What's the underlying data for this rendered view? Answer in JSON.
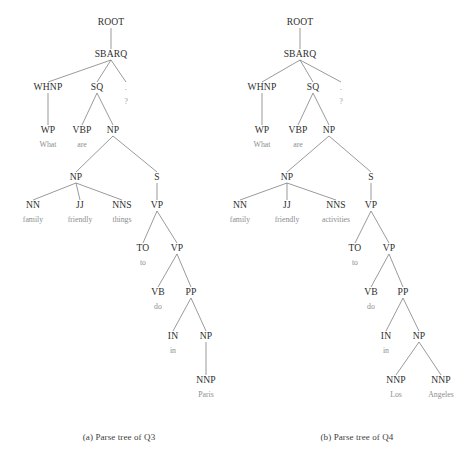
{
  "figure": {
    "background_color": "#ffffff",
    "node_color": "#2e2e2e",
    "leaf_color": "#8d8d8d",
    "edge_color": "#6f6f6f"
  },
  "subfigures": [
    {
      "id": "a",
      "caption": "(a) Parse tree of Q3",
      "sentence": "What are family friendly things to do in Paris ?",
      "nodes": [
        {
          "id": "a-root",
          "label": "ROOT",
          "x": 111,
          "y": 25,
          "type": "nonterminal"
        },
        {
          "id": "a-sbarq",
          "label": "SBARQ",
          "x": 111,
          "y": 57,
          "type": "nonterminal"
        },
        {
          "id": "a-whnp",
          "label": "WHNP",
          "x": 48,
          "y": 90,
          "type": "nonterminal"
        },
        {
          "id": "a-sq",
          "label": "SQ",
          "x": 97,
          "y": 90,
          "type": "nonterminal"
        },
        {
          "id": "a-punct",
          "label": ".",
          "x": 126,
          "y": 90,
          "type": "punct-nonterminal"
        },
        {
          "id": "a-wp",
          "label": "WP",
          "x": 48,
          "y": 133,
          "type": "preterminal"
        },
        {
          "id": "a-vbp",
          "label": "VBP",
          "x": 82,
          "y": 133,
          "type": "preterminal"
        },
        {
          "id": "a-np1",
          "label": "NP",
          "x": 113,
          "y": 133,
          "type": "nonterminal"
        },
        {
          "id": "a-np2",
          "label": "NP",
          "x": 76,
          "y": 180,
          "type": "nonterminal"
        },
        {
          "id": "a-s",
          "label": "S",
          "x": 157,
          "y": 180,
          "type": "nonterminal"
        },
        {
          "id": "a-nn",
          "label": "NN",
          "x": 33,
          "y": 208,
          "type": "preterminal"
        },
        {
          "id": "a-jj",
          "label": "JJ",
          "x": 80,
          "y": 208,
          "type": "preterminal"
        },
        {
          "id": "a-nns",
          "label": "NNS",
          "x": 122,
          "y": 208,
          "type": "preterminal"
        },
        {
          "id": "a-vp1",
          "label": "VP",
          "x": 157,
          "y": 208,
          "type": "nonterminal"
        },
        {
          "id": "a-to",
          "label": "TO",
          "x": 143,
          "y": 251,
          "type": "preterminal"
        },
        {
          "id": "a-vp2",
          "label": "VP",
          "x": 177,
          "y": 251,
          "type": "nonterminal"
        },
        {
          "id": "a-vb",
          "label": "VB",
          "x": 158,
          "y": 295,
          "type": "preterminal"
        },
        {
          "id": "a-pp",
          "label": "PP",
          "x": 191,
          "y": 295,
          "type": "nonterminal"
        },
        {
          "id": "a-in",
          "label": "IN",
          "x": 173,
          "y": 339,
          "type": "preterminal"
        },
        {
          "id": "a-np3",
          "label": "NP",
          "x": 206,
          "y": 339,
          "type": "nonterminal"
        },
        {
          "id": "a-nnp",
          "label": "NNP",
          "x": 206,
          "y": 383,
          "type": "preterminal"
        }
      ],
      "leaves": [
        {
          "id": "a-leaf-what",
          "label": "What",
          "x": 48,
          "y": 147,
          "parent": "a-wp"
        },
        {
          "id": "a-leaf-are",
          "label": "are",
          "x": 82,
          "y": 147,
          "parent": "a-vbp"
        },
        {
          "id": "a-leaf-q",
          "label": "?",
          "x": 126,
          "y": 104,
          "parent": "a-punct",
          "punct": true
        },
        {
          "id": "a-leaf-fam",
          "label": "family",
          "x": 33,
          "y": 222,
          "parent": "a-nn"
        },
        {
          "id": "a-leaf-frnd",
          "label": "friendly",
          "x": 80,
          "y": 222,
          "parent": "a-jj"
        },
        {
          "id": "a-leaf-thg",
          "label": "things",
          "x": 122,
          "y": 222,
          "parent": "a-nns"
        },
        {
          "id": "a-leaf-to",
          "label": "to",
          "x": 143,
          "y": 265,
          "parent": "a-to"
        },
        {
          "id": "a-leaf-do",
          "label": "do",
          "x": 158,
          "y": 309,
          "parent": "a-vb"
        },
        {
          "id": "a-leaf-in",
          "label": "in",
          "x": 173,
          "y": 353,
          "parent": "a-in"
        },
        {
          "id": "a-leaf-paris",
          "label": "Paris",
          "x": 206,
          "y": 397,
          "parent": "a-nnp"
        }
      ],
      "edges": [
        [
          "a-root",
          "a-sbarq"
        ],
        [
          "a-sbarq",
          "a-whnp"
        ],
        [
          "a-sbarq",
          "a-sq"
        ],
        [
          "a-sbarq",
          "a-punct"
        ],
        [
          "a-whnp",
          "a-wp"
        ],
        [
          "a-sq",
          "a-vbp"
        ],
        [
          "a-sq",
          "a-np1"
        ],
        [
          "a-np1",
          "a-np2"
        ],
        [
          "a-np1",
          "a-s"
        ],
        [
          "a-np2",
          "a-nn"
        ],
        [
          "a-np2",
          "a-jj"
        ],
        [
          "a-np2",
          "a-nns"
        ],
        [
          "a-s",
          "a-vp1"
        ],
        [
          "a-vp1",
          "a-to"
        ],
        [
          "a-vp1",
          "a-vp2"
        ],
        [
          "a-vp2",
          "a-vb"
        ],
        [
          "a-vp2",
          "a-pp"
        ],
        [
          "a-pp",
          "a-in"
        ],
        [
          "a-pp",
          "a-np3"
        ],
        [
          "a-np3",
          "a-nnp"
        ]
      ]
    },
    {
      "id": "b",
      "caption": "(b) Parse tree of Q4",
      "sentence": "What are family friendly activities to do in Los Angeles ?",
      "nodes": [
        {
          "id": "b-root",
          "label": "ROOT",
          "x": 300,
          "y": 25,
          "type": "nonterminal"
        },
        {
          "id": "b-sbarq",
          "label": "SBARQ",
          "x": 300,
          "y": 57,
          "type": "nonterminal"
        },
        {
          "id": "b-whnp",
          "label": "WHNP",
          "x": 262,
          "y": 90,
          "type": "nonterminal"
        },
        {
          "id": "b-sq",
          "label": "SQ",
          "x": 313,
          "y": 90,
          "type": "nonterminal"
        },
        {
          "id": "b-punct",
          "label": ".",
          "x": 341,
          "y": 90,
          "type": "punct-nonterminal"
        },
        {
          "id": "b-wp",
          "label": "WP",
          "x": 262,
          "y": 133,
          "type": "preterminal"
        },
        {
          "id": "b-vbp",
          "label": "VBP",
          "x": 298,
          "y": 133,
          "type": "preterminal"
        },
        {
          "id": "b-np1",
          "label": "NP",
          "x": 329,
          "y": 133,
          "type": "nonterminal"
        },
        {
          "id": "b-np2",
          "label": "NP",
          "x": 287,
          "y": 180,
          "type": "nonterminal"
        },
        {
          "id": "b-s",
          "label": "S",
          "x": 371,
          "y": 180,
          "type": "nonterminal"
        },
        {
          "id": "b-nn",
          "label": "NN",
          "x": 240,
          "y": 208,
          "type": "preterminal"
        },
        {
          "id": "b-jj",
          "label": "JJ",
          "x": 287,
          "y": 208,
          "type": "preterminal"
        },
        {
          "id": "b-nns",
          "label": "NNS",
          "x": 336,
          "y": 208,
          "type": "preterminal"
        },
        {
          "id": "b-vp1",
          "label": "VP",
          "x": 371,
          "y": 208,
          "type": "nonterminal"
        },
        {
          "id": "b-to",
          "label": "TO",
          "x": 355,
          "y": 251,
          "type": "preterminal"
        },
        {
          "id": "b-vp2",
          "label": "VP",
          "x": 389,
          "y": 251,
          "type": "nonterminal"
        },
        {
          "id": "b-vb",
          "label": "VB",
          "x": 371,
          "y": 295,
          "type": "preterminal"
        },
        {
          "id": "b-pp",
          "label": "PP",
          "x": 403,
          "y": 295,
          "type": "nonterminal"
        },
        {
          "id": "b-in",
          "label": "IN",
          "x": 386,
          "y": 339,
          "type": "preterminal"
        },
        {
          "id": "b-np3",
          "label": "NP",
          "x": 419,
          "y": 339,
          "type": "nonterminal"
        },
        {
          "id": "b-nnp1",
          "label": "NNP",
          "x": 396,
          "y": 383,
          "type": "preterminal"
        },
        {
          "id": "b-nnp2",
          "label": "NNP",
          "x": 441,
          "y": 383,
          "type": "preterminal"
        }
      ],
      "leaves": [
        {
          "id": "b-leaf-what",
          "label": "What",
          "x": 262,
          "y": 147,
          "parent": "b-wp"
        },
        {
          "id": "b-leaf-are",
          "label": "are",
          "x": 298,
          "y": 147,
          "parent": "b-vbp"
        },
        {
          "id": "b-leaf-q",
          "label": "?",
          "x": 341,
          "y": 104,
          "parent": "b-punct",
          "punct": true
        },
        {
          "id": "b-leaf-fam",
          "label": "family",
          "x": 240,
          "y": 222,
          "parent": "b-nn"
        },
        {
          "id": "b-leaf-frnd",
          "label": "friendly",
          "x": 287,
          "y": 222,
          "parent": "b-jj"
        },
        {
          "id": "b-leaf-act",
          "label": "activities",
          "x": 336,
          "y": 222,
          "parent": "b-nns"
        },
        {
          "id": "b-leaf-to",
          "label": "to",
          "x": 355,
          "y": 265,
          "parent": "b-to"
        },
        {
          "id": "b-leaf-do",
          "label": "do",
          "x": 371,
          "y": 309,
          "parent": "b-vb"
        },
        {
          "id": "b-leaf-in",
          "label": "in",
          "x": 386,
          "y": 353,
          "parent": "b-in"
        },
        {
          "id": "b-leaf-los",
          "label": "Los",
          "x": 396,
          "y": 397,
          "parent": "b-nnp1"
        },
        {
          "id": "b-leaf-ang",
          "label": "Angeles",
          "x": 441,
          "y": 397,
          "parent": "b-nnp2"
        }
      ],
      "edges": [
        [
          "b-root",
          "b-sbarq"
        ],
        [
          "b-sbarq",
          "b-whnp"
        ],
        [
          "b-sbarq",
          "b-sq"
        ],
        [
          "b-sbarq",
          "b-punct"
        ],
        [
          "b-whnp",
          "b-wp"
        ],
        [
          "b-sq",
          "b-vbp"
        ],
        [
          "b-sq",
          "b-np1"
        ],
        [
          "b-np1",
          "b-np2"
        ],
        [
          "b-np1",
          "b-s"
        ],
        [
          "b-np2",
          "b-nn"
        ],
        [
          "b-np2",
          "b-jj"
        ],
        [
          "b-np2",
          "b-nns"
        ],
        [
          "b-s",
          "b-vp1"
        ],
        [
          "b-vp1",
          "b-to"
        ],
        [
          "b-vp1",
          "b-vp2"
        ],
        [
          "b-vp2",
          "b-vb"
        ],
        [
          "b-vp2",
          "b-pp"
        ],
        [
          "b-pp",
          "b-in"
        ],
        [
          "b-pp",
          "b-np3"
        ],
        [
          "b-np3",
          "b-nnp1"
        ],
        [
          "b-np3",
          "b-nnp2"
        ]
      ]
    }
  ]
}
